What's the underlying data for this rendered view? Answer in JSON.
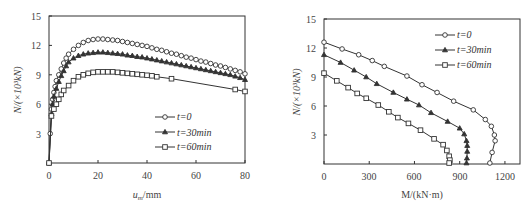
{
  "chart_data": [
    {
      "type": "line",
      "title": "",
      "xlabel": "u_m/mm",
      "xlabel_main": "u",
      "xlabel_sub": "m",
      "xlabel_unit": "/mm",
      "ylabel": "N/(×10³kN)",
      "xlim": [
        0,
        80
      ],
      "ylim": [
        0,
        15
      ],
      "xticks": [
        0,
        20,
        40,
        60,
        80
      ],
      "yticks": [
        3,
        6,
        9,
        12,
        15
      ],
      "grid": false,
      "legend_position": "lower right",
      "series": [
        {
          "name": "t=0",
          "marker": "circle",
          "x": [
            0,
            0.5,
            1,
            1.5,
            2,
            2.5,
            3,
            4,
            5,
            6,
            7,
            8,
            10,
            12,
            14,
            16,
            18,
            20,
            22,
            24,
            26,
            28,
            30,
            32,
            34,
            36,
            38,
            40,
            42,
            44,
            46,
            48,
            50,
            52,
            54,
            56,
            58,
            60,
            62,
            64,
            66,
            68,
            70,
            72,
            74,
            76,
            78,
            80
          ],
          "y": [
            0,
            3.0,
            5.5,
            6.5,
            7.2,
            7.8,
            8.4,
            9.0,
            9.6,
            10.2,
            10.7,
            11.1,
            11.6,
            12.0,
            12.3,
            12.5,
            12.6,
            12.65,
            12.65,
            12.6,
            12.55,
            12.5,
            12.4,
            12.3,
            12.2,
            12.1,
            12.0,
            11.9,
            11.75,
            11.6,
            11.5,
            11.35,
            11.2,
            11.1,
            10.95,
            10.8,
            10.7,
            10.55,
            10.4,
            10.3,
            10.15,
            10.0,
            9.9,
            9.75,
            9.6,
            9.45,
            9.3,
            9.1
          ]
        },
        {
          "name": "t=30min",
          "marker": "triangle",
          "x": [
            0,
            1,
            1.5,
            2,
            3,
            4,
            5,
            6,
            7,
            8,
            10,
            12,
            14,
            16,
            18,
            20,
            22,
            24,
            26,
            28,
            30,
            32,
            34,
            36,
            38,
            40,
            42,
            44,
            46,
            48,
            50,
            52,
            54,
            56,
            58,
            60,
            62,
            64,
            66,
            68,
            70,
            72,
            74,
            76,
            78,
            80
          ],
          "y": [
            0,
            5.0,
            6.0,
            6.8,
            7.6,
            8.3,
            8.9,
            9.4,
            9.9,
            10.3,
            10.7,
            10.95,
            11.1,
            11.2,
            11.25,
            11.3,
            11.3,
            11.25,
            11.2,
            11.15,
            11.1,
            11.0,
            10.95,
            10.85,
            10.8,
            10.7,
            10.6,
            10.5,
            10.4,
            10.3,
            10.2,
            10.1,
            10.0,
            9.9,
            9.8,
            9.7,
            9.6,
            9.5,
            9.4,
            9.3,
            9.2,
            9.1,
            9.0,
            8.85,
            8.7,
            8.5
          ]
        },
        {
          "name": "t=60min",
          "marker": "square",
          "x": [
            0,
            1,
            2,
            3,
            4,
            5,
            6,
            8,
            10,
            12,
            14,
            16,
            18,
            20,
            22,
            24,
            26,
            28,
            30,
            32,
            34,
            36,
            38,
            40,
            42,
            44,
            50,
            76,
            80
          ],
          "y": [
            0,
            4.8,
            5.5,
            6.0,
            6.5,
            7.0,
            7.4,
            7.9,
            8.4,
            8.8,
            9.0,
            9.15,
            9.25,
            9.3,
            9.3,
            9.3,
            9.3,
            9.25,
            9.2,
            9.15,
            9.1,
            9.05,
            9.0,
            8.95,
            8.9,
            8.8,
            8.6,
            7.5,
            7.3
          ]
        }
      ]
    },
    {
      "type": "line",
      "title": "",
      "xlabel": "M/(kN·m)",
      "ylabel": "N/(×10³kN)",
      "xlim": [
        0,
        1300
      ],
      "ylim": [
        0,
        15
      ],
      "xticks": [
        0,
        300,
        600,
        900,
        1200
      ],
      "yticks": [
        3,
        6,
        9,
        12,
        15
      ],
      "grid": false,
      "legend_position": "upper right",
      "series": [
        {
          "name": "t=0",
          "marker": "circle",
          "x": [
            0,
            120,
            230,
            320,
            400,
            550,
            650,
            750,
            860,
            990,
            1070,
            1110,
            1130,
            1135,
            1115,
            1100
          ],
          "y": [
            12.6,
            11.9,
            11.3,
            10.7,
            10.1,
            9.1,
            8.2,
            7.4,
            6.5,
            5.6,
            4.6,
            3.9,
            3.0,
            2.4,
            1.2,
            0.1
          ]
        },
        {
          "name": "t=30min",
          "marker": "triangle",
          "x": [
            0,
            110,
            200,
            280,
            350,
            460,
            550,
            630,
            710,
            820,
            900,
            930,
            945,
            950,
            950,
            948,
            945
          ],
          "y": [
            11.3,
            10.5,
            9.7,
            9.0,
            8.3,
            7.4,
            6.7,
            6.1,
            5.3,
            4.4,
            3.7,
            3.1,
            2.4,
            1.9,
            1.3,
            0.6,
            0.1
          ]
        },
        {
          "name": "t=60min",
          "marker": "square",
          "x": [
            0,
            85,
            160,
            220,
            280,
            360,
            430,
            490,
            560,
            640,
            730,
            790,
            815,
            830,
            835,
            830
          ],
          "y": [
            9.4,
            8.6,
            7.9,
            7.3,
            6.8,
            6.1,
            5.4,
            4.8,
            4.2,
            3.5,
            2.6,
            2.0,
            1.4,
            0.8,
            0.4,
            0.1
          ]
        }
      ]
    }
  ],
  "left": {
    "yaxis_label": "N/(×10³kN)",
    "xaxis_label_main": "u",
    "xaxis_label_sub": "m",
    "xaxis_label_unit": "/mm",
    "xtick_labels": [
      "0",
      "20",
      "40",
      "60",
      "80"
    ],
    "ytick_labels": [
      "3",
      "6",
      "9",
      "12",
      "15"
    ],
    "legend": [
      "t=0",
      "t=30min",
      "t=60min"
    ]
  },
  "right": {
    "yaxis_label": "N/(×10³kN)",
    "xaxis_label": "M/(kN·m)",
    "xtick_labels": [
      "0",
      "300",
      "600",
      "900",
      "1200"
    ],
    "ytick_labels": [
      "3",
      "6",
      "9",
      "12",
      "15"
    ],
    "legend": [
      "t=0",
      "t=30min",
      "t=60min"
    ]
  },
  "colors": {
    "line": "#333333",
    "axis": "#333333",
    "marker_fill": "#ffffff"
  }
}
